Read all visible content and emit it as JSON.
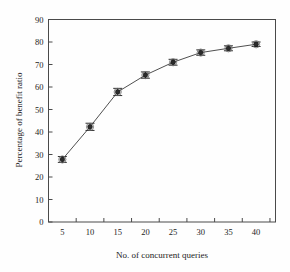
{
  "chart_data": {
    "type": "line",
    "title": "",
    "xlabel": "No. of concurrent queries",
    "ylabel": "Percentage of benefit ratio",
    "x": [
      5,
      10,
      15,
      20,
      25,
      30,
      35,
      40
    ],
    "values": [
      27.8,
      42.3,
      57.8,
      65.3,
      71.0,
      75.3,
      77.2,
      79.0
    ],
    "errors": [
      1.3,
      1.6,
      1.6,
      1.4,
      1.3,
      1.2,
      1.1,
      1.0
    ],
    "series": [
      {
        "name": "benefit ratio",
        "values": [
          27.8,
          42.3,
          57.8,
          65.3,
          71.0,
          75.3,
          77.2,
          79.0
        ]
      }
    ],
    "xlim": [
      2.5,
      43.5
    ],
    "ylim": [
      0,
      90
    ],
    "xticks": [
      5,
      10,
      15,
      20,
      25,
      30,
      35,
      40
    ],
    "yticks": [
      0,
      10,
      20,
      30,
      40,
      50,
      60,
      70,
      80,
      90
    ],
    "xtick_labels": [
      "5",
      "10",
      "15",
      "20",
      "25",
      "30",
      "35",
      "40"
    ],
    "ytick_labels": [
      "0",
      "10",
      "20",
      "30",
      "40",
      "50",
      "60",
      "70",
      "80",
      "90"
    ],
    "grid": false,
    "legend": null,
    "marker": "filled-circle-with-error-bars",
    "line_color": "#505050",
    "marker_color": "#2b2b2b"
  }
}
